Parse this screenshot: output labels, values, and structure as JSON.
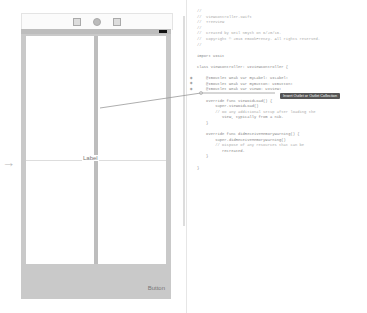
{
  "storyboard": {
    "scene_dock_icons": [
      "view-controller-icon",
      "first-responder-icon",
      "exit-icon"
    ],
    "label_text": "Label",
    "button_text": "Button",
    "entry_arrow": "initial-view-controller-arrow"
  },
  "editor": {
    "lines": [
      "//",
      "//  ViewController.swift",
      "//  TreeView",
      "//",
      "//  Created by Neil Smyth on 6/20/16.",
      "//  Copyright © 2016 eBookFrenzy. All rights reserved.",
      "//",
      "",
      "import UIKit",
      "",
      "class ViewController: UIViewController {",
      "",
      "    @IBOutlet weak var myLabel: UILabel!",
      "    @IBOutlet weak var myButton: UIButton!",
      "    @IBOutlet weak var viewO: UIView!",
      "",
      "    override func viewDidLoad() {",
      "        super.viewDidLoad()",
      "        // Do any additional setup after loading the",
      "           view, typically from a nib.",
      "    }",
      "",
      "    override func didReceiveMemoryWarning() {",
      "        super.didReceiveMemoryWarning()",
      "        // Dispose of any resources that can be",
      "           recreated.",
      "    }",
      "",
      "}"
    ],
    "tooltip": "Insert Outlet or Outlet Collection"
  }
}
